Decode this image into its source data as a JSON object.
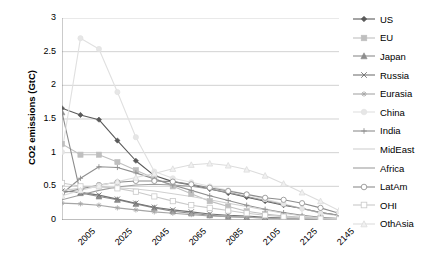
{
  "chart_data": {
    "type": "line",
    "title": "",
    "xlabel": "",
    "ylabel": "CO2 emissions (GtC)",
    "xlim": [
      2005,
      2155
    ],
    "ylim": [
      0,
      3
    ],
    "ytick_labels": [
      "0",
      "0.5",
      "1",
      "1.5",
      "2",
      "2.5",
      "3"
    ],
    "ytick_values": [
      0,
      0.5,
      1,
      1.5,
      2,
      2.5,
      3
    ],
    "xtick_labels": [
      "2005",
      "2025",
      "2045",
      "2065",
      "2085",
      "2105",
      "2125",
      "2145"
    ],
    "xtick_values": [
      2005,
      2025,
      2045,
      2065,
      2085,
      2105,
      2125,
      2145
    ],
    "grid": "horizontal",
    "legend_position": "right",
    "x": [
      2005,
      2015,
      2025,
      2035,
      2045,
      2055,
      2065,
      2075,
      2085,
      2095,
      2105,
      2115,
      2125,
      2135,
      2145,
      2155
    ],
    "series": [
      {
        "name": "US",
        "color": "#595959",
        "marker": "diamond",
        "marker_fill": "#595959",
        "values": [
          1.66,
          1.56,
          1.49,
          1.18,
          0.88,
          0.66,
          0.57,
          0.52,
          0.46,
          0.4,
          0.34,
          0.28,
          0.22,
          0.17,
          0.11,
          0.07
        ]
      },
      {
        "name": "EU",
        "color": "#bfbfbf",
        "marker": "square",
        "marker_fill": "#bfbfbf",
        "values": [
          1.13,
          0.97,
          0.97,
          0.86,
          0.74,
          0.62,
          0.5,
          0.39,
          0.28,
          0.2,
          0.13,
          0.09,
          0.06,
          0.04,
          0.03,
          0.02
        ]
      },
      {
        "name": "Japan",
        "color": "#8c8c8c",
        "marker": "triangle",
        "marker_fill": "#8c8c8c",
        "values": [
          1.6,
          0.4,
          0.35,
          0.3,
          0.24,
          0.18,
          0.13,
          0.1,
          0.07,
          0.05,
          0.04,
          0.03,
          0.02,
          0.02,
          0.01,
          0.01
        ]
      },
      {
        "name": "Russia",
        "color": "#737373",
        "marker": "cross",
        "marker_fill": "none",
        "values": [
          0.43,
          0.41,
          0.37,
          0.31,
          0.25,
          0.19,
          0.15,
          0.12,
          0.09,
          0.07,
          0.06,
          0.04,
          0.03,
          0.02,
          0.02,
          0.01
        ]
      },
      {
        "name": "Eurasia",
        "color": "#a6a6a6",
        "marker": "star",
        "marker_fill": "none",
        "values": [
          0.25,
          0.24,
          0.22,
          0.18,
          0.15,
          0.12,
          0.1,
          0.08,
          0.06,
          0.05,
          0.04,
          0.03,
          0.02,
          0.02,
          0.01,
          0.01
        ]
      },
      {
        "name": "China",
        "color": "#e0e0e0",
        "marker": "circle",
        "marker_fill": "#e6e6e6",
        "values": [
          1.01,
          2.7,
          2.54,
          1.9,
          1.23,
          0.72,
          0.62,
          0.56,
          0.5,
          0.44,
          0.38,
          0.31,
          0.24,
          0.17,
          0.1,
          0.06
        ]
      },
      {
        "name": "India",
        "color": "#8f8f8f",
        "marker": "plus",
        "marker_fill": "none",
        "values": [
          0.39,
          0.62,
          0.79,
          0.78,
          0.7,
          0.61,
          0.52,
          0.44,
          0.36,
          0.29,
          0.22,
          0.16,
          0.11,
          0.07,
          0.04,
          0.02
        ]
      },
      {
        "name": "MidEast",
        "color": "#d0d0d0",
        "marker": "none",
        "marker_fill": "none",
        "values": [
          0.44,
          0.47,
          0.49,
          0.48,
          0.46,
          0.43,
          0.39,
          0.35,
          0.3,
          0.25,
          0.2,
          0.15,
          0.1,
          0.06,
          0.03,
          0.02
        ]
      },
      {
        "name": "Africa",
        "color": "#9e9e9e",
        "marker": "none",
        "marker_fill": "none",
        "values": [
          0.3,
          0.37,
          0.44,
          0.49,
          0.52,
          0.53,
          0.52,
          0.5,
          0.46,
          0.41,
          0.35,
          0.29,
          0.23,
          0.17,
          0.11,
          0.07
        ]
      },
      {
        "name": "LatAm",
        "color": "#8c8c8c",
        "marker": "open-circle",
        "marker_fill": "#ffffff",
        "values": [
          0.4,
          0.46,
          0.52,
          0.56,
          0.58,
          0.58,
          0.57,
          0.53,
          0.48,
          0.43,
          0.38,
          0.33,
          0.3,
          0.25,
          0.18,
          0.1
        ]
      },
      {
        "name": "OHI",
        "color": "#c9c9c9",
        "marker": "open-square",
        "marker_fill": "#ffffff",
        "values": [
          0.55,
          0.5,
          0.5,
          0.47,
          0.42,
          0.35,
          0.28,
          0.22,
          0.18,
          0.14,
          0.1,
          0.07,
          0.05,
          0.03,
          0.02,
          0.01
        ]
      },
      {
        "name": "OthAsia",
        "color": "#dcdcdc",
        "marker": "open-triangle",
        "marker_fill": "#f0f0f0",
        "values": [
          0.36,
          0.44,
          0.51,
          0.57,
          0.63,
          0.69,
          0.76,
          0.82,
          0.84,
          0.81,
          0.75,
          0.66,
          0.54,
          0.41,
          0.28,
          0.14
        ]
      }
    ]
  },
  "legend": {
    "items": [
      {
        "label": "US"
      },
      {
        "label": "EU"
      },
      {
        "label": "Japan"
      },
      {
        "label": "Russia"
      },
      {
        "label": "Eurasia"
      },
      {
        "label": "China"
      },
      {
        "label": "India"
      },
      {
        "label": "MidEast"
      },
      {
        "label": "Africa"
      },
      {
        "label": "LatAm"
      },
      {
        "label": "OHI"
      },
      {
        "label": "OthAsia"
      }
    ]
  }
}
